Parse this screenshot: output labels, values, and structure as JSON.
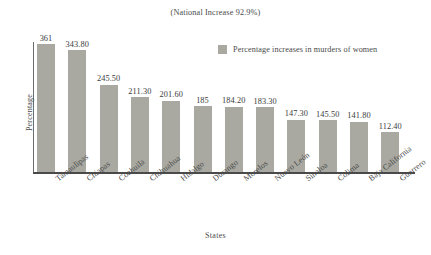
{
  "chart_data": {
    "type": "bar",
    "title": "(National Increase 92.9%)",
    "xlabel": "States",
    "ylabel": "Percentage",
    "grid": false,
    "legend_position": "top-right",
    "ylim": [
      0,
      400
    ],
    "legend": [
      "Percentage increases in murders of women"
    ],
    "series": [
      {
        "name": "Percentage increases in murders of women",
        "color": "#a9a9a1",
        "values": [
          361,
          343.8,
          245.5,
          211.3,
          201.6,
          185,
          184.2,
          183.3,
          147.3,
          145.5,
          141.8,
          112.4
        ]
      }
    ],
    "categories": [
      "Tamaulipas",
      "Chiapas",
      "Coahuila",
      "Chihuahua",
      "Hidalgo",
      "Durango",
      "Morelos",
      "Nuevo León",
      "Sinaloa",
      "Colima",
      "Baja California",
      "Guerrero"
    ],
    "value_labels": [
      "361",
      "343.80",
      "245.50",
      "211.30",
      "201.60",
      "185",
      "184.20",
      "183.30",
      "147.30",
      "145.50",
      "141.80",
      "112.40"
    ]
  },
  "colors": {
    "bar": "#a9a9a1",
    "axis": "#4a4a4a",
    "text": "#3b3b3b",
    "background": "#ffffff"
  }
}
